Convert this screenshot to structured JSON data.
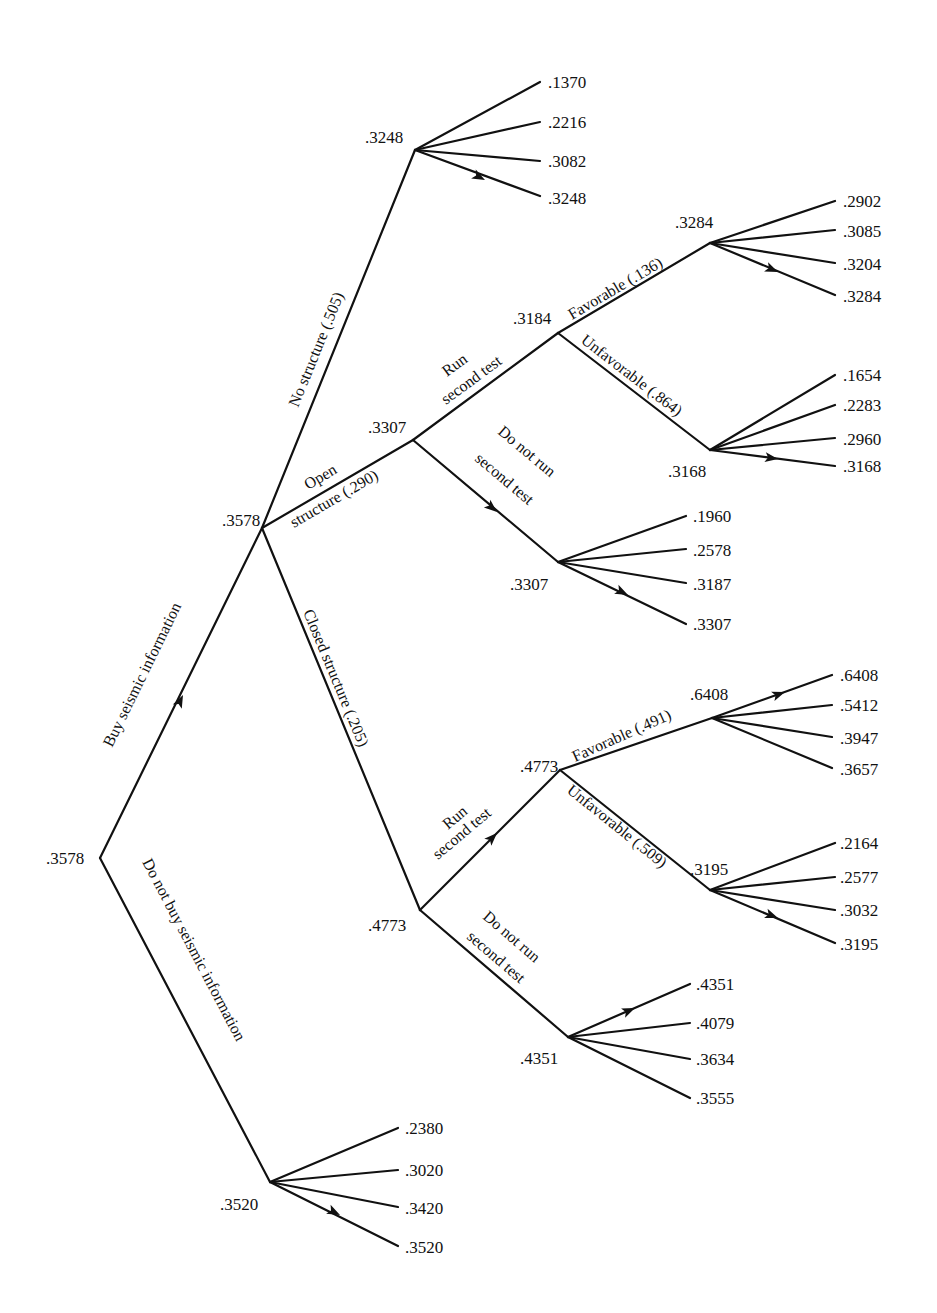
{
  "diagram": {
    "type": "decision-tree",
    "root": {
      "value": ".3578"
    },
    "branches": {
      "buy": {
        "label": "Buy seismic information",
        "value": ".3578"
      },
      "dont_buy": {
        "label": "Do not buy seismic information",
        "value": ".3520",
        "leaves": [
          ".2380",
          ".3020",
          ".3420",
          ".3520"
        ]
      },
      "no_structure": {
        "label": "No structure (.505)",
        "value": ".3248",
        "leaves": [
          ".1370",
          ".2216",
          ".3082",
          ".3248"
        ]
      },
      "open": {
        "label_line1": "Open",
        "label_line2": "structure (.290)",
        "value": ".3307",
        "run": {
          "label_line1": "Run",
          "label_line2": "second test",
          "value": ".3184",
          "favorable": {
            "label": "Favorable (.136)",
            "value": ".3284",
            "leaves": [
              ".2902",
              ".3085",
              ".3204",
              ".3284"
            ]
          },
          "unfavorable": {
            "label": "Unfavorable (.864)",
            "value": ".3168",
            "leaves": [
              ".1654",
              ".2283",
              ".2960",
              ".3168"
            ]
          }
        },
        "dont_run": {
          "label_line1": "Do not run",
          "label_line2": "second test",
          "value": ".3307",
          "leaves": [
            ".1960",
            ".2578",
            ".3187",
            ".3307"
          ]
        }
      },
      "closed": {
        "label": "Closed structure (.205)",
        "value": ".4773",
        "run": {
          "label_line1": "Run",
          "label_line2": "second test",
          "value": ".4773",
          "favorable": {
            "label": "Favorable (.491)",
            "value": ".6408",
            "leaves": [
              ".6408",
              ".5412",
              ".3947",
              ".3657"
            ]
          },
          "unfavorable": {
            "label": "Unfavorable (.509)",
            "value": ".3195",
            "leaves": [
              ".2164",
              ".2577",
              ".3032",
              ".3195"
            ]
          }
        },
        "dont_run": {
          "label_line1": "Do not run",
          "label_line2": "second test",
          "value": ".4351",
          "leaves": [
            ".4351",
            ".4079",
            ".3634",
            ".3555"
          ]
        }
      }
    }
  }
}
